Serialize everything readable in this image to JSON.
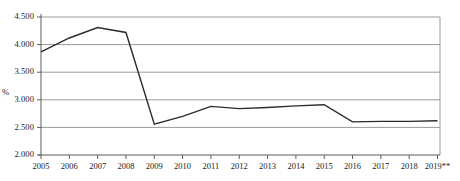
{
  "chart_data": {
    "type": "line",
    "title": "",
    "xlabel": "",
    "ylabel": "%",
    "categories": [
      "2005",
      "2006",
      "2007",
      "2008",
      "2009",
      "2010",
      "2011",
      "2012",
      "2013",
      "2014",
      "2015",
      "2016",
      "2017",
      "2018",
      "2019**"
    ],
    "x": [
      2005,
      2006,
      2007,
      2008,
      2009,
      2010,
      2011,
      2012,
      2013,
      2014,
      2015,
      2016,
      2017,
      2018,
      2019
    ],
    "values": [
      3.87,
      4.12,
      4.31,
      4.22,
      2.56,
      2.7,
      2.88,
      2.84,
      2.86,
      2.89,
      2.91,
      2.6,
      2.61,
      2.61,
      2.62
    ],
    "series": [
      {
        "name": "",
        "values": [
          3.87,
          4.12,
          4.31,
          4.22,
          2.56,
          2.7,
          2.88,
          2.84,
          2.86,
          2.89,
          2.91,
          2.6,
          2.61,
          2.61,
          2.62
        ]
      }
    ],
    "ylim": [
      2.0,
      4.5
    ],
    "ytick_labels": [
      "4.500",
      "4.000",
      "3.500",
      "3.000",
      "2.500",
      "2.000"
    ],
    "ytick_values": [
      4.5,
      4.0,
      3.5,
      3.0,
      2.5,
      2.0
    ],
    "grid": "horizontal",
    "legend": "none",
    "line_color": "#2b2b2b",
    "grid_color": "#9a9a9a",
    "axis_color": "#6e6e6e",
    "footnote_marker": "**"
  }
}
